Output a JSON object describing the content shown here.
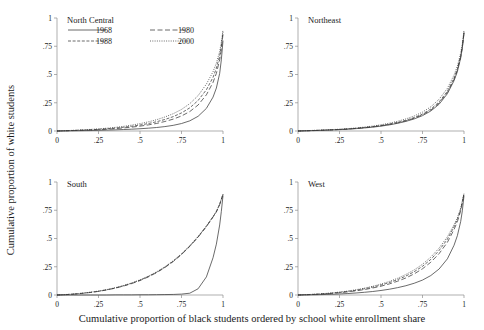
{
  "figure": {
    "xlabel": "Cumulative proportion of black students ordered by school white enrollment share",
    "ylabel": "Cumulative proportion of white students",
    "background": "#ffffff",
    "line_color": "#3a3a3a",
    "axis_color": "#8c8c8c"
  },
  "legend": {
    "entries": [
      {
        "label": "1968",
        "style": "solid"
      },
      {
        "label": "1980",
        "style": "long-dash"
      },
      {
        "label": "1988",
        "style": "dash"
      },
      {
        "label": "2000",
        "style": "dotted"
      }
    ]
  },
  "axes": {
    "xticks": [
      "0",
      ".25",
      ".5",
      ".75",
      "1"
    ],
    "xtick_values": [
      0,
      0.25,
      0.5,
      0.75,
      1
    ],
    "yticks": [
      "0",
      ".25",
      ".5",
      ".75",
      "1"
    ],
    "ytick_values": [
      0,
      0.25,
      0.5,
      0.75,
      1
    ],
    "xlim": [
      0,
      1
    ],
    "ylim": [
      0,
      1
    ]
  },
  "panels": [
    {
      "title": "North Central"
    },
    {
      "title": "Northeast"
    },
    {
      "title": "South"
    },
    {
      "title": "West"
    }
  ],
  "chart_data": {
    "type": "line",
    "title": "",
    "subtitle": "",
    "xlabel": "Cumulative proportion of black students ordered by school white enrollment share",
    "ylabel": "Cumulative proportion of white students",
    "xlim": [
      0,
      1
    ],
    "ylim": [
      0,
      1
    ],
    "grid": false,
    "legend_position": "top-left-inside-panel-1",
    "legend_entries": [
      "1968",
      "1980",
      "1988",
      "2000"
    ],
    "panel_layout": "2x2",
    "x": [
      0,
      0.05,
      0.1,
      0.15,
      0.2,
      0.25,
      0.3,
      0.35,
      0.4,
      0.45,
      0.5,
      0.55,
      0.6,
      0.65,
      0.7,
      0.75,
      0.8,
      0.85,
      0.9,
      0.94,
      0.96,
      0.98,
      0.99,
      1
    ],
    "panels": [
      {
        "name": "North Central",
        "series": [
          {
            "name": "1968",
            "style": "solid",
            "values": [
              0,
              0.001,
              0.002,
              0.003,
              0.004,
              0.006,
              0.008,
              0.01,
              0.013,
              0.016,
              0.02,
              0.025,
              0.031,
              0.039,
              0.05,
              0.066,
              0.09,
              0.13,
              0.2,
              0.3,
              0.38,
              0.51,
              0.63,
              0.8
            ]
          },
          {
            "name": "1980",
            "style": "long-dash",
            "values": [
              0,
              0.002,
              0.004,
              0.006,
              0.009,
              0.012,
              0.016,
              0.021,
              0.027,
              0.034,
              0.043,
              0.054,
              0.067,
              0.084,
              0.105,
              0.133,
              0.172,
              0.23,
              0.32,
              0.43,
              0.51,
              0.63,
              0.72,
              0.86
            ]
          },
          {
            "name": "1988",
            "style": "dash",
            "values": [
              0,
              0.002,
              0.005,
              0.008,
              0.011,
              0.015,
              0.02,
              0.026,
              0.033,
              0.042,
              0.053,
              0.066,
              0.082,
              0.102,
              0.127,
              0.16,
              0.205,
              0.27,
              0.365,
              0.475,
              0.555,
              0.665,
              0.75,
              0.875
            ]
          },
          {
            "name": "2000",
            "style": "dotted",
            "values": [
              0,
              0.003,
              0.006,
              0.01,
              0.014,
              0.019,
              0.025,
              0.032,
              0.041,
              0.052,
              0.065,
              0.081,
              0.1,
              0.124,
              0.153,
              0.191,
              0.242,
              0.313,
              0.415,
              0.525,
              0.6,
              0.705,
              0.785,
              0.895
            ]
          }
        ]
      },
      {
        "name": "Northeast",
        "series": [
          {
            "name": "1968",
            "style": "solid",
            "values": [
              0,
              0.002,
              0.004,
              0.006,
              0.009,
              0.012,
              0.016,
              0.021,
              0.027,
              0.034,
              0.043,
              0.054,
              0.068,
              0.085,
              0.107,
              0.136,
              0.177,
              0.237,
              0.33,
              0.445,
              0.525,
              0.645,
              0.735,
              0.865
            ]
          },
          {
            "name": "1980",
            "style": "long-dash",
            "values": [
              0,
              0.002,
              0.004,
              0.007,
              0.01,
              0.013,
              0.017,
              0.023,
              0.029,
              0.037,
              0.046,
              0.058,
              0.072,
              0.09,
              0.113,
              0.143,
              0.185,
              0.247,
              0.341,
              0.457,
              0.537,
              0.655,
              0.742,
              0.87
            ]
          },
          {
            "name": "1988",
            "style": "dash",
            "values": [
              0,
              0.002,
              0.005,
              0.007,
              0.01,
              0.014,
              0.018,
              0.024,
              0.031,
              0.039,
              0.049,
              0.061,
              0.076,
              0.095,
              0.119,
              0.15,
              0.194,
              0.257,
              0.352,
              0.468,
              0.548,
              0.665,
              0.75,
              0.875
            ]
          },
          {
            "name": "2000",
            "style": "dotted",
            "values": [
              0,
              0.003,
              0.006,
              0.009,
              0.012,
              0.016,
              0.021,
              0.027,
              0.035,
              0.044,
              0.055,
              0.069,
              0.086,
              0.107,
              0.133,
              0.167,
              0.214,
              0.281,
              0.378,
              0.495,
              0.575,
              0.69,
              0.772,
              0.89
            ]
          }
        ]
      },
      {
        "name": "South",
        "series": [
          {
            "name": "1968",
            "style": "solid",
            "values": [
              0,
              0.0,
              0.0,
              0.0,
              0.0,
              0.0,
              0.0,
              0.001,
              0.001,
              0.001,
              0.002,
              0.002,
              0.003,
              0.004,
              0.005,
              0.008,
              0.016,
              0.055,
              0.16,
              0.33,
              0.45,
              0.62,
              0.74,
              0.88
            ]
          },
          {
            "name": "1980",
            "style": "long-dash",
            "values": [
              0,
              0.003,
              0.008,
              0.014,
              0.022,
              0.032,
              0.045,
              0.06,
              0.079,
              0.101,
              0.128,
              0.16,
              0.198,
              0.243,
              0.296,
              0.358,
              0.43,
              0.512,
              0.605,
              0.69,
              0.735,
              0.8,
              0.845,
              0.89
            ]
          },
          {
            "name": "1988",
            "style": "dash",
            "values": [
              0,
              0.003,
              0.008,
              0.015,
              0.023,
              0.033,
              0.046,
              0.062,
              0.081,
              0.104,
              0.131,
              0.163,
              0.201,
              0.246,
              0.299,
              0.361,
              0.433,
              0.515,
              0.608,
              0.692,
              0.738,
              0.802,
              0.847,
              0.89
            ]
          },
          {
            "name": "2000",
            "style": "dotted",
            "values": [
              0,
              0.004,
              0.009,
              0.016,
              0.025,
              0.035,
              0.048,
              0.064,
              0.084,
              0.107,
              0.134,
              0.167,
              0.205,
              0.25,
              0.303,
              0.365,
              0.437,
              0.519,
              0.611,
              0.695,
              0.74,
              0.804,
              0.849,
              0.892
            ]
          }
        ]
      },
      {
        "name": "West",
        "series": [
          {
            "name": "1968",
            "style": "solid",
            "values": [
              0,
              0.001,
              0.002,
              0.004,
              0.006,
              0.009,
              0.013,
              0.018,
              0.024,
              0.031,
              0.04,
              0.051,
              0.065,
              0.082,
              0.104,
              0.132,
              0.172,
              0.23,
              0.32,
              0.44,
              0.525,
              0.65,
              0.745,
              0.88
            ]
          },
          {
            "name": "1980",
            "style": "long-dash",
            "values": [
              0,
              0.002,
              0.005,
              0.009,
              0.014,
              0.02,
              0.028,
              0.037,
              0.048,
              0.062,
              0.078,
              0.098,
              0.122,
              0.151,
              0.187,
              0.232,
              0.29,
              0.366,
              0.466,
              0.58,
              0.648,
              0.745,
              0.815,
              0.895
            ]
          },
          {
            "name": "1988",
            "style": "dash",
            "values": [
              0,
              0.003,
              0.006,
              0.011,
              0.016,
              0.023,
              0.032,
              0.042,
              0.055,
              0.07,
              0.088,
              0.11,
              0.136,
              0.168,
              0.206,
              0.254,
              0.315,
              0.394,
              0.494,
              0.604,
              0.668,
              0.758,
              0.825,
              0.898
            ]
          },
          {
            "name": "2000",
            "style": "dotted",
            "values": [
              0,
              0.003,
              0.007,
              0.012,
              0.018,
              0.026,
              0.035,
              0.047,
              0.061,
              0.077,
              0.097,
              0.12,
              0.148,
              0.182,
              0.222,
              0.272,
              0.335,
              0.415,
              0.515,
              0.622,
              0.683,
              0.77,
              0.833,
              0.9
            ]
          }
        ]
      }
    ]
  }
}
